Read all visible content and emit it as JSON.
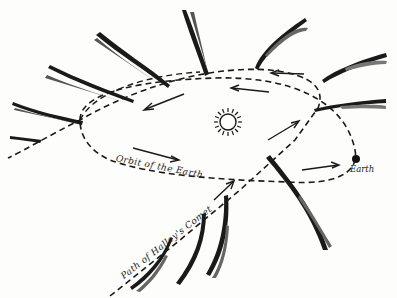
{
  "diagram": {
    "labels": {
      "orbit": "Orbit of the Earth",
      "path": "Path of Halley's Comet",
      "earth": "Earth"
    },
    "elements": {
      "sun": "sun-symbol",
      "earth": "earth-dot",
      "earth_orbit": "dashed-ellipse",
      "comet_path": "dashed-parabola",
      "comet_positions": 13,
      "direction_arrows": 7
    },
    "colors": {
      "ink": "#1a1a1a",
      "paper": "#fdfdfb"
    }
  }
}
